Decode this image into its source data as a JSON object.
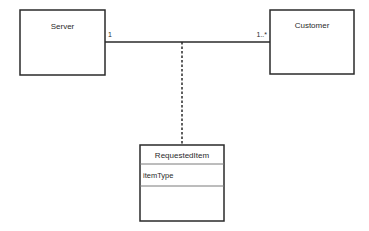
{
  "diagram": {
    "type": "uml-class-diagram",
    "classes": [
      {
        "id": "server",
        "name": "Server",
        "attributes": []
      },
      {
        "id": "customer",
        "name": "Customer",
        "attributes": []
      },
      {
        "id": "requested-item",
        "name": "RequestedItem",
        "attributes": [
          "itemType"
        ],
        "is_association_class": true
      }
    ],
    "associations": [
      {
        "from": "server",
        "to": "customer",
        "from_multiplicity": "1",
        "to_multiplicity": "1..*",
        "association_class": "requested-item"
      }
    ],
    "colors": {
      "stroke": "#2a2a2a",
      "divider": "#7a7a7a",
      "background": "#ffffff"
    }
  }
}
